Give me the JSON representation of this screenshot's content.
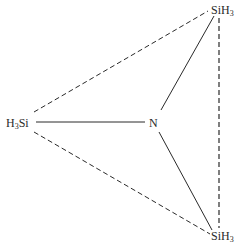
{
  "diagram": {
    "title": "",
    "atoms": [
      {
        "id": "si_top",
        "element": "Si",
        "suffix_h": "H",
        "subscript": "3",
        "order": "SiH",
        "text": "SiH3"
      },
      {
        "id": "si_left",
        "prefix": "H",
        "subscript": "3",
        "element": "Si",
        "order": "H3Si",
        "text": "H3Si"
      },
      {
        "id": "n_center",
        "element": "N",
        "text": "N"
      },
      {
        "id": "si_bottom",
        "element": "Si",
        "suffix_h": "H",
        "subscript": "3",
        "order": "SiH",
        "text": "SiH3"
      }
    ],
    "bonds": [
      {
        "from": "n_center",
        "to": "si_top",
        "style": "solid"
      },
      {
        "from": "n_center",
        "to": "si_left",
        "style": "solid"
      },
      {
        "from": "n_center",
        "to": "si_bottom",
        "style": "solid"
      },
      {
        "from": "si_left",
        "to": "si_top",
        "style": "dashed"
      },
      {
        "from": "si_left",
        "to": "si_bottom",
        "style": "dashed"
      },
      {
        "from": "si_top",
        "to": "si_bottom",
        "style": "dashed"
      }
    ],
    "colors": {
      "line": "#2a2a2a",
      "text": "#2a2a2a",
      "background": "#ffffff"
    }
  }
}
